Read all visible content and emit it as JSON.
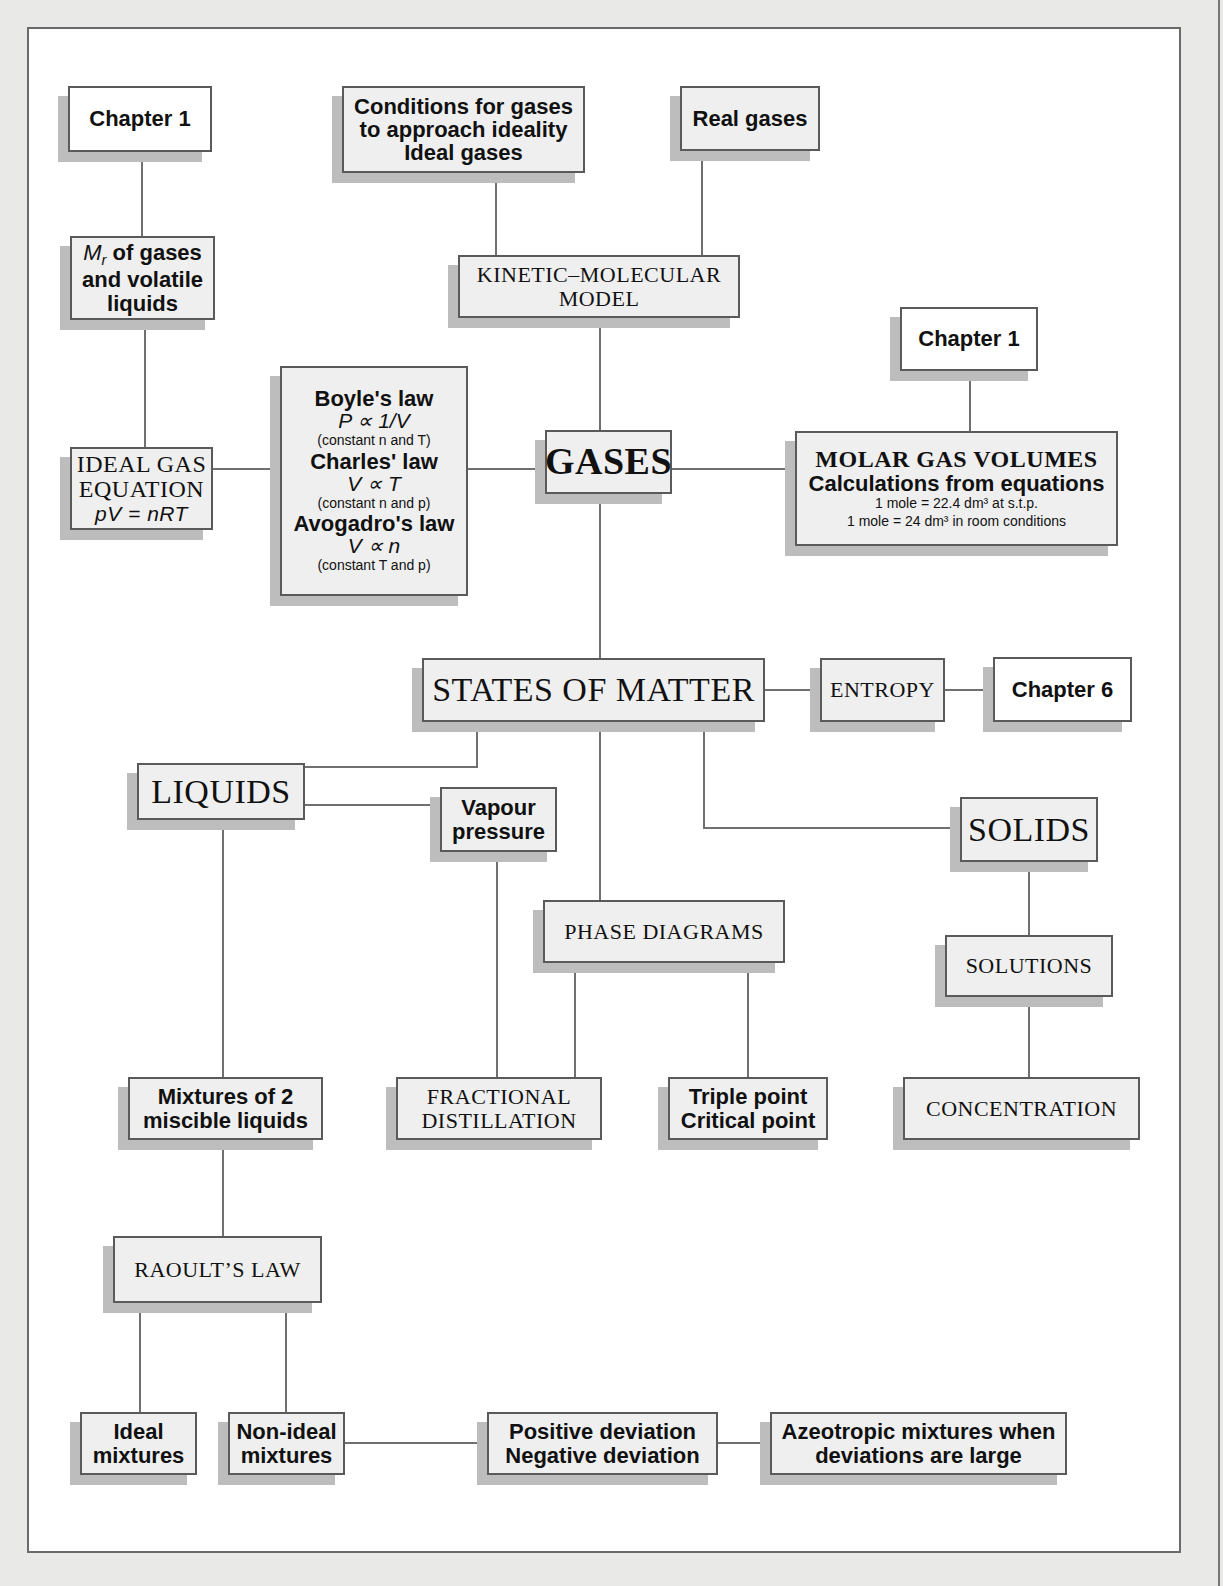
{
  "diagram": {
    "nodes": {
      "chapter1_left": {
        "label": "Chapter 1"
      },
      "mr_gases": {
        "lines": [
          "M",
          "r",
          " of gases",
          "and volatile",
          "liquids"
        ]
      },
      "ideal_gas_equation": {
        "line1": "IDEAL GAS",
        "line2": "EQUATION",
        "formula": "pV = nRT"
      },
      "gas_laws": {
        "boyle_title": "Boyle's law",
        "boyle_formula": "P ∝ 1/V",
        "boyle_note": "(constant n and T)",
        "charles_title": "Charles' law",
        "charles_formula": "V ∝ T",
        "charles_note": "(constant n and p)",
        "avogadro_title": "Avogadro's law",
        "avogadro_formula": "V ∝ n",
        "avogadro_note": "(constant T and p)"
      },
      "conditions_ideality": {
        "line1": "Conditions for gases",
        "line2": "to approach ideality",
        "line3": "Ideal gases"
      },
      "real_gases": {
        "label": "Real gases"
      },
      "kinetic_molecular": {
        "line1": "KINETIC–MOLECULAR",
        "line2": "MODEL"
      },
      "gases": {
        "label": "GASES"
      },
      "chapter1_right": {
        "label": "Chapter 1"
      },
      "molar_gas_volumes": {
        "title": "MOLAR GAS VOLUMES",
        "subtitle": "Calculations from equations",
        "note1": "1 mole = 22.4 dm³ at s.t.p.",
        "note2": "1 mole = 24 dm³ in room conditions"
      },
      "states_of_matter": {
        "label": "STATES OF MATTER"
      },
      "entropy": {
        "label": "ENTROPY"
      },
      "chapter6": {
        "label": "Chapter 6"
      },
      "liquids": {
        "label": "LIQUIDS"
      },
      "vapour_pressure": {
        "line1": "Vapour",
        "line2": "pressure"
      },
      "solids": {
        "label": "SOLIDS"
      },
      "phase_diagrams": {
        "label": "PHASE DIAGRAMS"
      },
      "solutions": {
        "label": "SOLUTIONS"
      },
      "mixtures": {
        "line1": "Mixtures of 2",
        "line2": "miscible liquids"
      },
      "fractional_distillation": {
        "line1": "FRACTIONAL",
        "line2": "DISTILLATION"
      },
      "triple_critical": {
        "line1": "Triple point",
        "line2": "Critical point"
      },
      "concentration": {
        "label": "CONCENTRATION"
      },
      "raoults_law": {
        "label": "RAOULT’S LAW"
      },
      "ideal_mixtures": {
        "line1": "Ideal",
        "line2": "mixtures"
      },
      "non_ideal_mixtures": {
        "line1": "Non-ideal",
        "line2": "mixtures"
      },
      "deviations": {
        "line1": "Positive deviation",
        "line2": "Negative deviation"
      },
      "azeotropic": {
        "line1": "Azeotropic mixtures when",
        "line2": "deviations are large"
      }
    },
    "edges": [
      [
        "chapter1_left",
        "mr_gases"
      ],
      [
        "mr_gases",
        "ideal_gas_equation"
      ],
      [
        "ideal_gas_equation",
        "gas_laws"
      ],
      [
        "gas_laws",
        "gases"
      ],
      [
        "conditions_ideality",
        "kinetic_molecular"
      ],
      [
        "real_gases",
        "kinetic_molecular"
      ],
      [
        "kinetic_molecular",
        "gases"
      ],
      [
        "chapter1_right",
        "molar_gas_volumes"
      ],
      [
        "gases",
        "molar_gas_volumes"
      ],
      [
        "gases",
        "states_of_matter"
      ],
      [
        "states_of_matter",
        "entropy"
      ],
      [
        "entropy",
        "chapter6"
      ],
      [
        "states_of_matter",
        "liquids"
      ],
      [
        "states_of_matter",
        "phase_diagrams"
      ],
      [
        "states_of_matter",
        "solids"
      ],
      [
        "liquids",
        "vapour_pressure"
      ],
      [
        "vapour_pressure",
        "fractional_distillation"
      ],
      [
        "phase_diagrams",
        "fractional_distillation"
      ],
      [
        "phase_diagrams",
        "triple_critical"
      ],
      [
        "solids",
        "solutions"
      ],
      [
        "solutions",
        "concentration"
      ],
      [
        "liquids",
        "mixtures"
      ],
      [
        "mixtures",
        "raoults_law"
      ],
      [
        "raoults_law",
        "ideal_mixtures"
      ],
      [
        "raoults_law",
        "non_ideal_mixtures"
      ],
      [
        "non_ideal_mixtures",
        "deviations"
      ],
      [
        "deviations",
        "azeotropic"
      ]
    ],
    "colors": {
      "background": "#e9e9e7",
      "frame": "#ffffff",
      "box_fill": "#efefef",
      "box_border": "#5a5a5a",
      "box_shadow": "#bdbdbd",
      "connector": "#707070"
    }
  }
}
